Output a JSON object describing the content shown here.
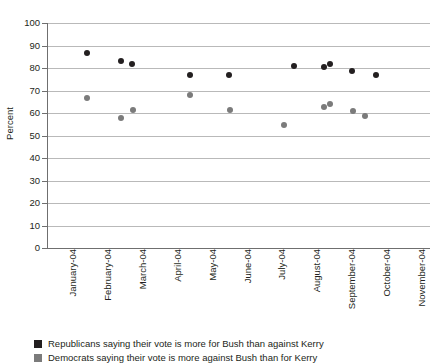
{
  "chart_data": {
    "type": "scatter",
    "title": "",
    "xlabel": "",
    "ylabel": "Percent",
    "ylim": [
      0,
      100
    ],
    "ytick_step": 10,
    "grid": true,
    "legend_position": "bottom-left",
    "categories": [
      "January-04",
      "February-04",
      "March-04",
      "April-04",
      "May-04",
      "June-04",
      "July-04",
      "August-04",
      "September-04",
      "October-04",
      "November-04"
    ],
    "ytick_labels": [
      "0",
      "10",
      "20",
      "30",
      "40",
      "50",
      "60",
      "70",
      "80",
      "90",
      "100"
    ],
    "series": [
      {
        "name": "Republicans saying their vote is more for Bush than against Kerry",
        "color": "#231f20",
        "key": "rep",
        "points": [
          {
            "x": 1.65,
            "y": 86.5
          },
          {
            "x": 2.63,
            "y": 83.0
          },
          {
            "x": 2.95,
            "y": 82.0
          },
          {
            "x": 4.6,
            "y": 77.0
          },
          {
            "x": 5.72,
            "y": 76.8
          },
          {
            "x": 7.6,
            "y": 81.0
          },
          {
            "x": 8.45,
            "y": 80.5
          },
          {
            "x": 8.62,
            "y": 82.0
          },
          {
            "x": 9.25,
            "y": 78.8
          },
          {
            "x": 9.95,
            "y": 77.0
          }
        ]
      },
      {
        "name": "Democrats saying their vote is more against Bush than for Kerry",
        "color": "#7b7b7b",
        "key": "dem",
        "points": [
          {
            "x": 1.65,
            "y": 66.5
          },
          {
            "x": 2.63,
            "y": 58.0
          },
          {
            "x": 2.98,
            "y": 61.5
          },
          {
            "x": 4.62,
            "y": 68.0
          },
          {
            "x": 5.75,
            "y": 61.5
          },
          {
            "x": 7.3,
            "y": 54.5
          },
          {
            "x": 8.45,
            "y": 62.5
          },
          {
            "x": 8.62,
            "y": 64.0
          },
          {
            "x": 9.28,
            "y": 61.0
          },
          {
            "x": 9.62,
            "y": 58.5
          }
        ]
      }
    ]
  },
  "legend": [
    {
      "key": "rep",
      "label": "Republicans saying their vote is more for Bush than against Kerry"
    },
    {
      "key": "dem",
      "label": "Democrats saying their vote is more against Bush than for Kerry"
    }
  ]
}
